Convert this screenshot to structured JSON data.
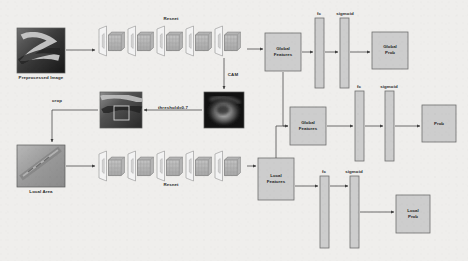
{
  "figure": {
    "background_color": "#f2f1ef",
    "line_color": "#4a4a4a",
    "box_fill": "#cfcfcf",
    "box_stroke": "#6e6e6e"
  },
  "images": [
    {
      "name": "preprocessed-image",
      "label": "Preprocessed Image",
      "x": 17,
      "y": 28,
      "w": 48,
      "h": 45
    },
    {
      "name": "cropped-image",
      "label": "",
      "x": 100,
      "y": 92,
      "w": 42,
      "h": 36
    },
    {
      "name": "cam-image",
      "label": "",
      "x": 204,
      "y": 92,
      "w": 40,
      "h": 36
    },
    {
      "name": "local-area-image",
      "label": "Local Area",
      "x": 17,
      "y": 145,
      "w": 48,
      "h": 42
    }
  ],
  "labels": {
    "resnet_top": "Resnet",
    "resnet_bottom": "Resnet",
    "cam": "CAM",
    "crop": "crop",
    "threshold": "threshold=0.7",
    "preprocessed_image": "Preprocessed Image",
    "local_area": "Local Area",
    "fc_top": "fc",
    "sigmoid_top": "sigmoid",
    "fc_mid": "fc",
    "sigmoid_mid": "sigmoid",
    "fc_bottom": "fc",
    "sigmoid_bottom": "sigmoid"
  },
  "boxes": [
    {
      "name": "global-features-top",
      "label": "Global\nFeatures",
      "line1": "Global",
      "line2": "Features",
      "x": 265,
      "y": 33,
      "w": 36,
      "h": 38
    },
    {
      "name": "fc-top",
      "label": "fc",
      "x": 315,
      "y": 18,
      "w": 9,
      "h": 70
    },
    {
      "name": "sigmoid-top",
      "label": "sigmoid",
      "x": 340,
      "y": 18,
      "w": 9,
      "h": 70
    },
    {
      "name": "global-prob",
      "label": "Global\nProb",
      "line1": "Global",
      "line2": "Prob",
      "x": 372,
      "y": 32,
      "w": 36,
      "h": 37
    },
    {
      "name": "global-features-mid",
      "label": "Global\nFeatures",
      "line1": "Global",
      "line2": "Features",
      "x": 290,
      "y": 107,
      "w": 36,
      "h": 38
    },
    {
      "name": "fc-mid",
      "label": "fc",
      "x": 355,
      "y": 91,
      "w": 9,
      "h": 70
    },
    {
      "name": "sigmoid-mid",
      "label": "sigmoid",
      "x": 385,
      "y": 91,
      "w": 9,
      "h": 70
    },
    {
      "name": "prob",
      "label": "Prob",
      "x": 422,
      "y": 105,
      "w": 34,
      "h": 37
    },
    {
      "name": "local-features",
      "label": "Local\nFeatures",
      "line1": "Local",
      "line2": "Features",
      "x": 258,
      "y": 158,
      "w": 36,
      "h": 42
    },
    {
      "name": "fc-bottom",
      "label": "fc",
      "x": 320,
      "y": 176,
      "w": 9,
      "h": 72
    },
    {
      "name": "sigmoid-bottom",
      "label": "sigmoid",
      "x": 350,
      "y": 176,
      "w": 9,
      "h": 72
    },
    {
      "name": "local-prob",
      "label": "Local\nProb",
      "line1": "Local",
      "line2": "Prob",
      "x": 396,
      "y": 195,
      "w": 34,
      "h": 38
    }
  ],
  "resnet_blocks": {
    "top": {
      "x": 97,
      "y": 26,
      "w": 148,
      "h": 30,
      "stages": 5
    },
    "bottom": {
      "x": 97,
      "y": 152,
      "w": 148,
      "h": 28,
      "stages": 5
    }
  },
  "flow": [
    "Preprocessed Image -> Resnet (top) -> Global Features",
    "Resnet (top) -> CAM",
    "CAM -> threshold=0.7 -> cropped image",
    "cropped image -> crop -> Local Area",
    "Local Area -> Resnet (bottom) -> Local Features",
    "Global Features -> fc -> sigmoid -> Global Prob",
    "Global Features -> Global Features (fusion) -> fc -> sigmoid -> Prob",
    "Local Features -> fc -> sigmoid -> Local Prob",
    "Local Features -> fusion branch"
  ]
}
